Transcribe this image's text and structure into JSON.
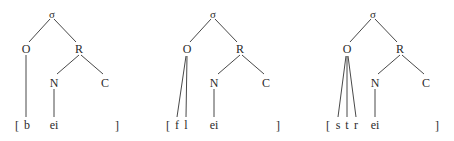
{
  "diagram": {
    "title": "",
    "trees": [
      {
        "id": "tree-b",
        "root": "σ",
        "onset": "O",
        "rime": "R",
        "nucleus": "N",
        "coda": "C",
        "open_bracket": "[",
        "onset_segments": [
          "b"
        ],
        "nucleus_segment": "ei",
        "close_bracket": "]"
      },
      {
        "id": "tree-fl",
        "root": "σ",
        "onset": "O",
        "rime": "R",
        "nucleus": "N",
        "coda": "C",
        "open_bracket": "[",
        "onset_segments": [
          "f",
          "l"
        ],
        "nucleus_segment": "ei",
        "close_bracket": "]"
      },
      {
        "id": "tree-str",
        "root": "σ",
        "onset": "O",
        "rime": "R",
        "nucleus": "N",
        "coda": "C",
        "open_bracket": "[",
        "onset_segments": [
          "s",
          "t",
          "r"
        ],
        "nucleus_segment": "ei",
        "close_bracket": "]"
      }
    ],
    "colors": {
      "line": "#333333",
      "text": "#2a2a2a",
      "background": "#ffffff"
    }
  }
}
